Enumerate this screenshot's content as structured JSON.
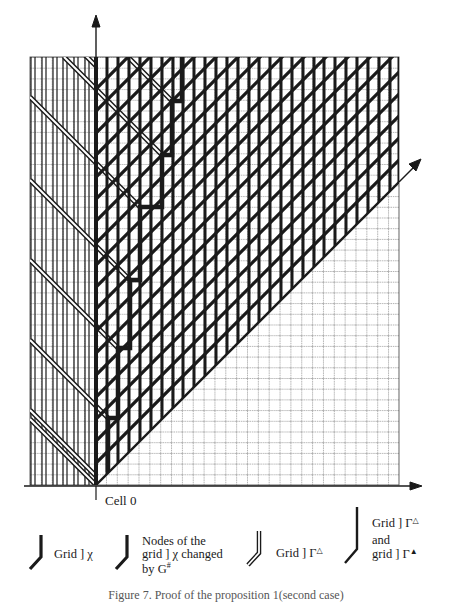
{
  "figure": {
    "axes": {
      "origin_label": "Cell 0",
      "vertical_axis": "time (upward arrow)",
      "horizontal_axis": "cells (rightward arrow)",
      "diagonal_axis": "light-speed diagonal (arrow up-right)"
    },
    "grid": {
      "left": 30,
      "right": 399,
      "top": 57,
      "bottom": 485,
      "cell_w": 10.85,
      "cell_h": 10.7
    },
    "colors": {
      "ink": "#1a1a1a",
      "paper": "#ffffff",
      "fine_grid": "#555555"
    }
  },
  "legend": {
    "items": [
      {
        "icon": "thick-bent-line-icon",
        "label": "Grid ] χ"
      },
      {
        "icon": "thick-bent-line-icon",
        "label_line1": "Nodes of the",
        "label_line2": "grid ] χ changed",
        "label_line3": "by G",
        "label_sup": "#"
      },
      {
        "icon": "double-bent-line-icon",
        "label": "Grid ] Γ",
        "label_tri": "△"
      },
      {
        "icon": "tall-bent-line-icon",
        "label_line1": "Grid ] Γ",
        "label_tri1": "△",
        "label_line2": "and",
        "label_line3": "grid ] Γ",
        "label_tri3": "▲"
      }
    ]
  },
  "caption": "Figure 7. Proof of the proposition 1(second case)"
}
